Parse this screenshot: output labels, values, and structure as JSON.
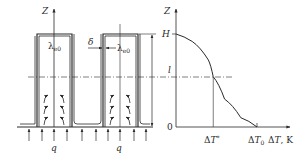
{
  "figure": {
    "left_panel": {
      "axis_label": "Z",
      "fin_labels": [
        "λe0",
        "λe0"
      ],
      "gap_label": "δ",
      "heat_flux_label": "q",
      "heat_flux_labels": [
        "q",
        "q"
      ],
      "fin_count": 2,
      "heat_arrows_per_fin_side": 3
    },
    "right_panel": {
      "y_axis_label": "Z",
      "x_axis_label": "ΔT, K",
      "y_ticks": [
        "H",
        "l",
        "0"
      ],
      "x_ticks": [
        "ΔT*",
        "ΔT0"
      ],
      "curve_description": "Z decreases from H at ΔT=0 to 0 at ΔT0, passing l at ΔT*"
    }
  },
  "chart_data": {
    "type": "line",
    "title": "",
    "xlabel": "ΔT, K",
    "ylabel": "Z",
    "x_tick_labels": [
      "ΔT*",
      "ΔT0"
    ],
    "y_tick_labels": [
      "0",
      "l",
      "H"
    ],
    "series": [
      {
        "name": "Z(ΔT)",
        "points_normalized": [
          [
            0.0,
            1.0
          ],
          [
            0.2,
            0.92
          ],
          [
            0.4,
            0.72
          ],
          [
            0.46,
            0.54
          ],
          [
            0.6,
            0.3
          ],
          [
            0.8,
            0.1
          ],
          [
            1.0,
            0.0
          ]
        ]
      }
    ],
    "reference_points": {
      "H": 1.0,
      "l": 0.54,
      "dT_star": 0.46,
      "dT0": 1.0
    },
    "grid": false
  }
}
